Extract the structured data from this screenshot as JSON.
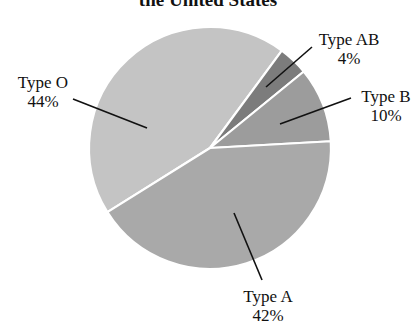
{
  "chart_data": {
    "type": "pie",
    "title": "the United States",
    "title_visible_portion": "the United States",
    "slices": [
      {
        "label": "Type O",
        "value": 44,
        "display": "44%",
        "color": "#c4c4c4"
      },
      {
        "label": "Type AB",
        "value": 4,
        "display": "4%",
        "color": "#7c7c7c"
      },
      {
        "label": "Type B",
        "value": 10,
        "display": "10%",
        "color": "#9c9c9c"
      },
      {
        "label": "Type A",
        "value": 42,
        "display": "42%",
        "color": "#a9a9a9"
      }
    ],
    "legend": "none (leader-line labels)",
    "center": [
      210,
      148
    ],
    "radius": 121
  },
  "labels": {
    "title": "the United States",
    "o_name": "Type O",
    "o_pct": "44%",
    "ab_name": "Type AB",
    "ab_pct": "4%",
    "b_name": "Type B",
    "b_pct": "10%",
    "a_name": "Type A",
    "a_pct": "42%"
  }
}
